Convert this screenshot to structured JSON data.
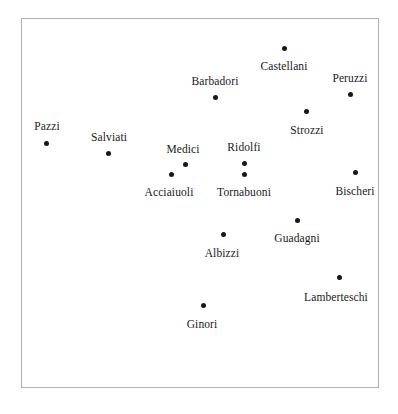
{
  "figure": {
    "background_color": "#ffffff",
    "frame_color": "#b0b0b0",
    "point_color": "#171717",
    "label_color": "#1a1a1a",
    "width": 398,
    "height": 414
  },
  "chart_data": {
    "type": "scatter",
    "title": "",
    "subtitle": "",
    "xlabel": "",
    "ylabel": "",
    "xlim": [
      0,
      358
    ],
    "ylim": [
      0,
      370
    ],
    "grid": false,
    "legend": null,
    "axis_ticks": {
      "x": [],
      "y": []
    },
    "point_marker": "filled-circle",
    "point_size_px": 5,
    "points": [
      {
        "label": "Castellani",
        "x": 262,
        "y": 29,
        "label_pos": "below",
        "label_dx": 0,
        "label_dy": 12
      },
      {
        "label": "Peruzzi",
        "x": 328,
        "y": 75,
        "label_pos": "above",
        "label_dx": 0,
        "label_dy": -10
      },
      {
        "label": "Barbadori",
        "x": 193,
        "y": 78,
        "label_pos": "above",
        "label_dx": 0,
        "label_dy": -10
      },
      {
        "label": "Strozzi",
        "x": 284,
        "y": 92,
        "label_pos": "below",
        "label_dx": 1,
        "label_dy": 13
      },
      {
        "label": "Pazzi",
        "x": 24,
        "y": 124,
        "label_pos": "above",
        "label_dx": 1,
        "label_dy": -11
      },
      {
        "label": "Salviati",
        "x": 86,
        "y": 134,
        "label_pos": "above",
        "label_dx": 1,
        "label_dy": -10
      },
      {
        "label": "Ridolfi",
        "x": 222,
        "y": 144,
        "label_pos": "above",
        "label_dx": 0,
        "label_dy": -10
      },
      {
        "label": "Medici",
        "x": 163,
        "y": 145,
        "label_pos": "above",
        "label_dx": -2,
        "label_dy": -9
      },
      {
        "label": "Bischeri",
        "x": 333,
        "y": 153,
        "label_pos": "below",
        "label_dx": 0,
        "label_dy": 13
      },
      {
        "label": "Acciaiuoli",
        "x": 149,
        "y": 155,
        "label_pos": "below",
        "label_dx": -2,
        "label_dy": 12
      },
      {
        "label": "Tornabuoni",
        "x": 222,
        "y": 155,
        "label_pos": "below",
        "label_dx": 0,
        "label_dy": 12
      },
      {
        "label": "Guadagni",
        "x": 275,
        "y": 201,
        "label_pos": "below",
        "label_dx": 0,
        "label_dy": 12
      },
      {
        "label": "Albizzi",
        "x": 201,
        "y": 215,
        "label_pos": "below",
        "label_dx": -1,
        "label_dy": 13
      },
      {
        "label": "Lamberteschi",
        "x": 317,
        "y": 258,
        "label_pos": "below",
        "label_dx": -3,
        "label_dy": 14
      },
      {
        "label": "Ginori",
        "x": 181,
        "y": 286,
        "label_pos": "below",
        "label_dx": -1,
        "label_dy": 13
      }
    ]
  }
}
